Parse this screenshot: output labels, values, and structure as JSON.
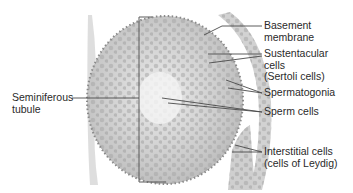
{
  "diagram": {
    "labels": {
      "basement_membrane": [
        "Basement",
        "membrane"
      ],
      "sustentacular": [
        "Sustentacular",
        "cells",
        "(Sertoli cells)"
      ],
      "spermatogonia": [
        "Spermatogonia"
      ],
      "sperm_cells": [
        "Sperm cells"
      ],
      "interstitial": [
        "Interstitial cells",
        "(cells of Leydig)"
      ],
      "seminiferous_tubule": [
        "Seminiferous",
        "tubule"
      ]
    },
    "colors": {
      "background": "#ffffff",
      "tissue_light": "#e4e4e4",
      "tissue_mid": "#b8b8b8",
      "nucleus": "#7a7a7a",
      "leader_line": "#4a4a4a",
      "text": "#2a2a2a"
    }
  }
}
